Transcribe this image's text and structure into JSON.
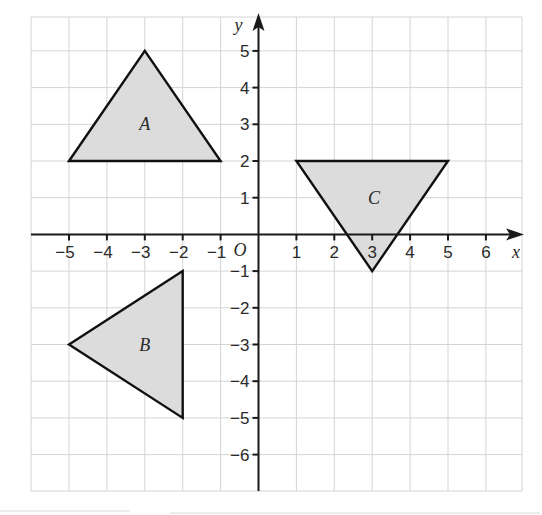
{
  "diagram": {
    "type": "coordinate-grid",
    "axes": {
      "x_label": "x",
      "y_label": "y",
      "origin_label": "O",
      "x_ticks": [
        -5,
        -4,
        -3,
        -2,
        -1,
        1,
        2,
        3,
        4,
        5,
        6
      ],
      "y_ticks": [
        5,
        4,
        3,
        2,
        1,
        -1,
        -2,
        -3,
        -4,
        -5,
        -6
      ],
      "x_tick_labels": [
        "−5",
        "−4",
        "−3",
        "−2",
        "−1",
        "1",
        "2",
        "3",
        "4",
        "5",
        "6"
      ],
      "y_tick_labels": [
        "5",
        "4",
        "3",
        "2",
        "1",
        "−1",
        "−2",
        "−3",
        "−4",
        "−5",
        "−6"
      ],
      "x_range": [
        -6,
        7
      ],
      "y_range": [
        -7,
        6
      ]
    },
    "shapes": [
      {
        "label": "A",
        "vertices": [
          [
            -5,
            2
          ],
          [
            -3,
            5
          ],
          [
            -1,
            2
          ]
        ],
        "label_pos": [
          -3,
          3
        ]
      },
      {
        "label": "B",
        "vertices": [
          [
            -2,
            -1
          ],
          [
            -5,
            -3
          ],
          [
            -2,
            -5
          ]
        ],
        "label_pos": [
          -3,
          -3
        ]
      },
      {
        "label": "C",
        "vertices": [
          [
            1,
            2
          ],
          [
            5,
            2
          ],
          [
            3,
            -1
          ]
        ],
        "label_pos": [
          3.05,
          1
        ]
      }
    ],
    "colors": {
      "shape_fill": "#dcdcdc",
      "shape_stroke": "#111111",
      "grid": "#d4d4d4",
      "axis": "#1a1a1a"
    }
  }
}
